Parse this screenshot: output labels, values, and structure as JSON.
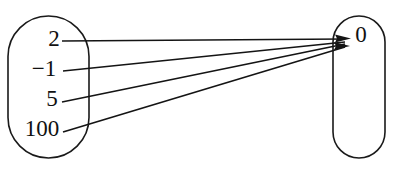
{
  "diagram": {
    "type": "mapping-diagram",
    "stroke_color": "#141414",
    "oval_stroke_color": "#1a1a1a",
    "background_color": "#ffffff",
    "domain": {
      "name": "domain-oval",
      "elements": [
        {
          "label": "2",
          "x": 54,
          "y": 41
        },
        {
          "label": "−1",
          "x": 44,
          "y": 71
        },
        {
          "label": "5",
          "x": 52,
          "y": 101
        },
        {
          "label": "100",
          "x": 42,
          "y": 131
        }
      ]
    },
    "codomain": {
      "name": "codomain-oval",
      "elements": [
        {
          "label": "0",
          "x": 361,
          "y": 37
        }
      ]
    },
    "mappings": [
      {
        "from": "2",
        "to": "0"
      },
      {
        "from": "−1",
        "to": "0"
      },
      {
        "from": "5",
        "to": "0"
      },
      {
        "from": "100",
        "to": "0"
      }
    ]
  }
}
